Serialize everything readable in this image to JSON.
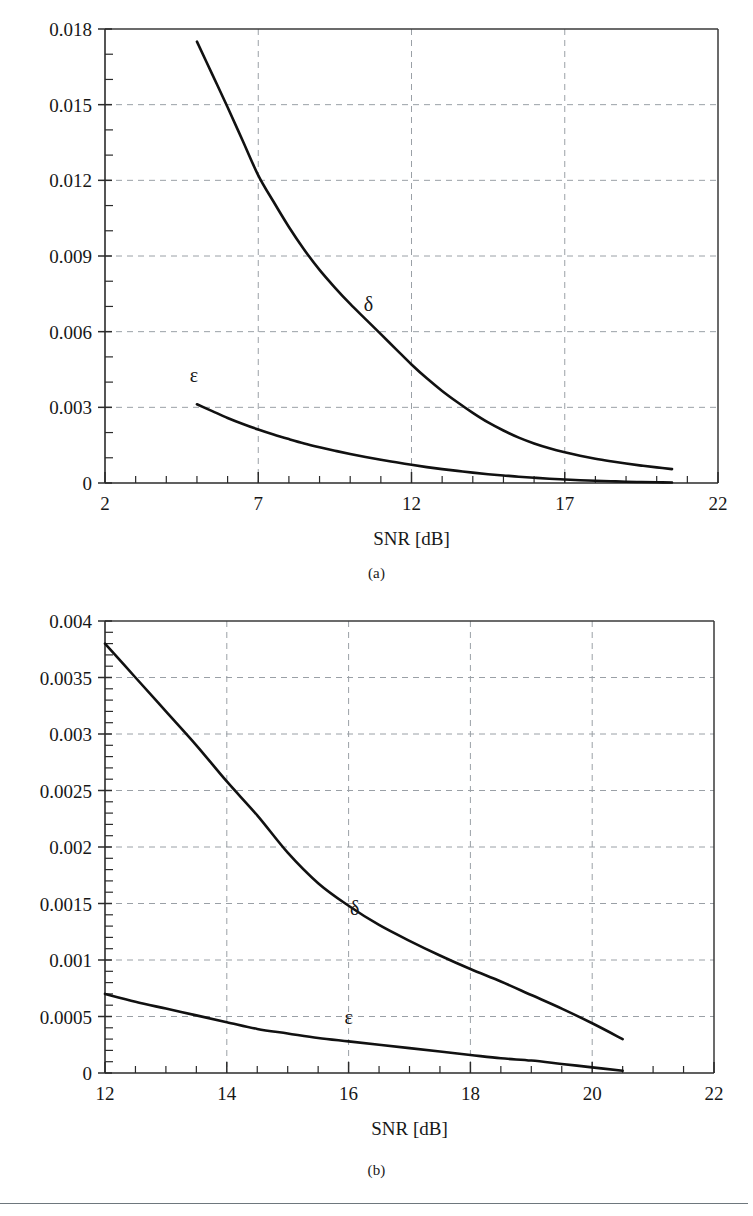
{
  "figures": [
    {
      "id": "a",
      "subcaption": "(a)"
    },
    {
      "id": "b",
      "subcaption": "(b)"
    }
  ],
  "chart_data": [
    {
      "type": "line",
      "panel": "(a)",
      "title": "",
      "xlabel": "SNR [dB]",
      "ylabel": "",
      "xlim": [
        2,
        22
      ],
      "ylim": [
        0,
        0.018
      ],
      "xticks": [
        2,
        7,
        12,
        17,
        22
      ],
      "xtick_labels": [
        "2",
        "7",
        "12",
        "17",
        "22"
      ],
      "xminor_step": 1,
      "yticks": [
        0,
        0.003,
        0.006,
        0.009,
        0.012,
        0.015,
        0.018
      ],
      "ytick_labels": [
        "0",
        "0.003",
        "0.006",
        "0.009",
        "0.012",
        "0.015",
        "0.018"
      ],
      "yminor_step": 0.001,
      "grid": "dashed-both",
      "legend": "inline-annotations",
      "series": [
        {
          "name": "δ",
          "label": "δ",
          "label_x": 10.6,
          "label_y": 0.0068,
          "x": [
            5.0,
            5.5,
            6.0,
            6.5,
            7.0,
            7.5,
            8.0,
            8.5,
            9.0,
            9.5,
            10.0,
            10.5,
            11.0,
            11.5,
            12.0,
            12.5,
            13.0,
            13.5,
            14.0,
            14.5,
            15.0,
            15.5,
            16.0,
            16.5,
            17.0,
            17.5,
            18.0,
            18.5,
            19.0,
            19.5,
            20.0,
            20.5
          ],
          "y": [
            0.0175,
            0.0162,
            0.0149,
            0.01355,
            0.0122,
            0.01115,
            0.01015,
            0.00925,
            0.00845,
            0.00775,
            0.0071,
            0.0065,
            0.0059,
            0.0053,
            0.0047,
            0.00415,
            0.00365,
            0.0032,
            0.00278,
            0.0024,
            0.00208,
            0.0018,
            0.00157,
            0.00138,
            0.00122,
            0.00108,
            0.00096,
            0.00086,
            0.00077,
            0.00069,
            0.00062,
            0.00055
          ]
        },
        {
          "name": "ε",
          "label": "ε",
          "label_x": 4.9,
          "label_y": 0.004,
          "x": [
            5.0,
            5.5,
            6.0,
            6.5,
            7.0,
            7.5,
            8.0,
            8.5,
            9.0,
            9.5,
            10.0,
            10.5,
            11.0,
            11.5,
            12.0,
            12.5,
            13.0,
            13.5,
            14.0,
            14.5,
            15.0,
            15.5,
            16.0,
            16.5,
            17.0,
            17.5,
            18.0,
            18.5,
            19.0,
            19.5,
            20.0,
            20.5
          ],
          "y": [
            0.00312,
            0.00285,
            0.00258,
            0.00234,
            0.00212,
            0.00192,
            0.00174,
            0.00157,
            0.00142,
            0.00128,
            0.00115,
            0.00103,
            0.00092,
            0.00082,
            0.00072,
            0.00063,
            0.00055,
            0.00048,
            0.00041,
            0.00035,
            0.0003,
            0.00025,
            0.00021,
            0.00017,
            0.00014,
            0.00011,
            9e-05,
            7e-05,
            5e-05,
            4e-05,
            3e-05,
            2e-05
          ]
        }
      ]
    },
    {
      "type": "line",
      "panel": "(b)",
      "title": "",
      "xlabel": "SNR [dB]",
      "ylabel": "",
      "xlim": [
        12,
        22
      ],
      "ylim": [
        0,
        0.004
      ],
      "xticks": [
        12,
        14,
        16,
        18,
        20,
        22
      ],
      "xtick_labels": [
        "12",
        "14",
        "16",
        "18",
        "20",
        "22"
      ],
      "xminor_step": 0.5,
      "yticks": [
        0,
        0.0005,
        0.001,
        0.0015,
        0.002,
        0.0025,
        0.003,
        0.0035,
        0.004
      ],
      "ytick_labels": [
        "0",
        "0.0005",
        "0.001",
        "0.0015",
        "0.002",
        "0.0025",
        "0.003",
        "0.0035",
        "0.004"
      ],
      "yminor_step": 0.0001,
      "grid": "dashed-both",
      "legend": "inline-annotations",
      "series": [
        {
          "name": "δ",
          "label": "δ",
          "label_x": 16.1,
          "label_y": 0.0014,
          "x": [
            12.0,
            12.5,
            13.0,
            13.5,
            14.0,
            14.5,
            15.0,
            15.5,
            16.0,
            16.5,
            17.0,
            17.5,
            18.0,
            18.5,
            19.0,
            19.5,
            20.0,
            20.5
          ],
          "y": [
            0.0038,
            0.0035,
            0.0032,
            0.0029,
            0.00258,
            0.00228,
            0.00195,
            0.00168,
            0.00148,
            0.00131,
            0.00117,
            0.00104,
            0.00092,
            0.00081,
            0.00069,
            0.00057,
            0.00044,
            0.0003
          ]
        },
        {
          "name": "ε",
          "label": "ε",
          "label_x": 16.0,
          "label_y": 0.00043,
          "x": [
            12.0,
            12.5,
            13.0,
            13.5,
            14.0,
            14.5,
            15.0,
            15.5,
            16.0,
            16.5,
            17.0,
            17.5,
            18.0,
            18.5,
            19.0,
            19.5,
            20.0,
            20.5
          ],
          "y": [
            0.0007,
            0.00063,
            0.00057,
            0.00051,
            0.00045,
            0.00039,
            0.00035,
            0.00031,
            0.00028,
            0.00025,
            0.00022,
            0.00019,
            0.00016,
            0.00013,
            0.00011,
            8e-05,
            5e-05,
            2e-05
          ]
        }
      ]
    }
  ],
  "colors": {
    "curve": "#111111",
    "axis": "#2b2b2b",
    "grid": "#9aa0a6",
    "text": "#171717",
    "rule": "#555f66"
  }
}
